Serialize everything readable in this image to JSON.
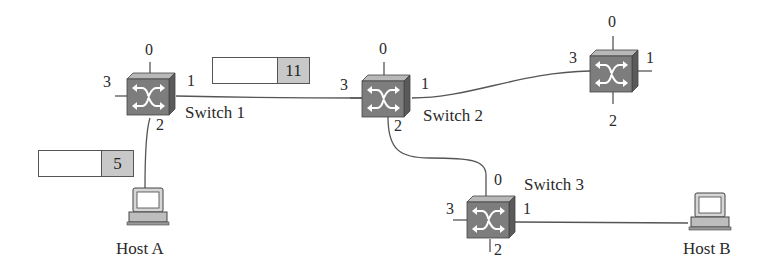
{
  "diagram": {
    "switches": [
      {
        "id": "switch1",
        "label": "Switch 1",
        "ports": [
          "0",
          "1",
          "2",
          "3"
        ]
      },
      {
        "id": "switch2",
        "label": "Switch 2",
        "ports": [
          "0",
          "1",
          "2",
          "3"
        ]
      },
      {
        "id": "switch3",
        "label": "Switch 3",
        "ports": [
          "0",
          "1",
          "2",
          "3"
        ]
      },
      {
        "id": "switch4",
        "label": "",
        "ports": [
          "0",
          "1",
          "2",
          "3"
        ]
      }
    ],
    "hosts": [
      {
        "id": "hostA",
        "label": "Host  A"
      },
      {
        "id": "hostB",
        "label": "Host  B"
      }
    ],
    "headers": [
      {
        "id": "header-host-a",
        "value": "5"
      },
      {
        "id": "header-switch1",
        "value": "11"
      }
    ],
    "links": [
      {
        "from": "Host A",
        "to": "Switch 1 port 2"
      },
      {
        "from": "Switch 1 port 1",
        "to": "Switch 2 port 3"
      },
      {
        "from": "Switch 2 port 1",
        "to": "Switch 4 port 3"
      },
      {
        "from": "Switch 2 port 2",
        "to": "Switch 3 port 0"
      },
      {
        "from": "Switch 3 port 1",
        "to": "Host B"
      }
    ],
    "colors": {
      "switch_body": "#7d7d7d",
      "switch_top": "#b4b4b4",
      "header_value_bg": "#c8c8c8",
      "line": "#555555"
    }
  }
}
